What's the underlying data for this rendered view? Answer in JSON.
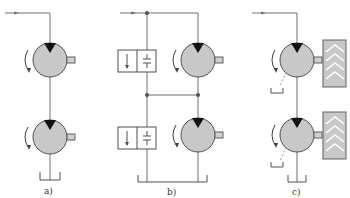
{
  "figure": {
    "colors": {
      "line": "#707070",
      "pump_fill": "#c8c8c8",
      "indicator": "#111111",
      "wheel_fill": "#c8c8c8"
    },
    "panels": [
      {
        "id": "a",
        "label": "a)",
        "components": [
          "inlet-line",
          "motor-1",
          "motor-2",
          "tank"
        ]
      },
      {
        "id": "b",
        "label": "b)",
        "components": [
          "inlet-line",
          "valve-1",
          "motor-1",
          "valve-2",
          "motor-2",
          "tank"
        ]
      },
      {
        "id": "c",
        "label": "c)",
        "components": [
          "inlet-line",
          "motor-1",
          "wheel-1",
          "motor-2",
          "wheel-2",
          "drain-1",
          "drain-2",
          "tank"
        ]
      }
    ]
  }
}
